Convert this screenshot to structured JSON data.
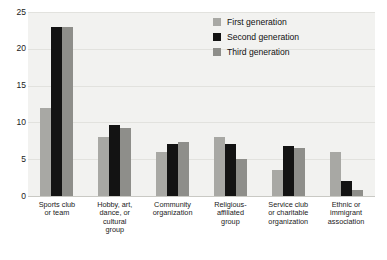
{
  "chart_data": {
    "type": "bar",
    "title": "",
    "subtitle": "",
    "xlabel": "",
    "ylabel": "",
    "ylim": [
      0,
      25
    ],
    "yticks": [
      0,
      5,
      10,
      15,
      20,
      25
    ],
    "grid": true,
    "legend_position": "top-right",
    "categories": [
      "Sports club or team",
      "Hobby, art, dance, or cultural group",
      "Community organization",
      "Religious-affiliated group",
      "Service club or charitable organization",
      "Ethnic or immigrant association"
    ],
    "category_lines": [
      [
        "Sports club",
        "or team"
      ],
      [
        "Hobby, art,",
        "dance, or",
        "cultural",
        "group"
      ],
      [
        "Community",
        "organization"
      ],
      [
        "Religious-",
        "affiliated",
        "group"
      ],
      [
        "Service club",
        "or charitable",
        "organization"
      ],
      [
        "Ethnic or",
        "immigrant",
        "association"
      ]
    ],
    "series": [
      {
        "name": "First generation",
        "color": "#a8a8a4",
        "values": [
          12.0,
          8.0,
          6.0,
          8.0,
          3.6,
          6.0
        ]
      },
      {
        "name": "Second generation",
        "color": "#131313",
        "values": [
          23.0,
          9.7,
          7.0,
          7.0,
          6.8,
          2.0
        ]
      },
      {
        "name": "Third generation",
        "color": "#8e8e8a",
        "values": [
          23.0,
          9.3,
          7.4,
          5.0,
          6.5,
          0.8
        ]
      }
    ]
  },
  "legend": {
    "items": [
      {
        "label": "First generation",
        "color": "#a8a8a4"
      },
      {
        "label": "Second generation",
        "color": "#131313"
      },
      {
        "label": "Third generation",
        "color": "#8e8e8a"
      }
    ]
  }
}
